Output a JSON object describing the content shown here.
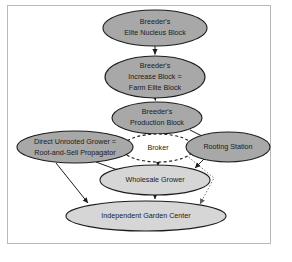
{
  "diagram": {
    "frame": {
      "border_color": "#b9b9b9",
      "background": "#ffffff"
    },
    "palette": {
      "node_dark_fill": "#a8a8a8",
      "node_light_fill": "#d6d6d6",
      "node_open_fill": "#ffffff",
      "stroke": "#1c1c1c",
      "dotted_edge": "#7d7d7d"
    },
    "nodes": [
      {
        "id": "elite-nucleus-block",
        "label_lines": [
          "Breeder's",
          "Elite Nucleus Block"
        ],
        "style": "dark-filled-ellipse",
        "cx": 155,
        "cy": 28,
        "rx": 52,
        "ry": 18
      },
      {
        "id": "increase-block",
        "label_lines": [
          "Breeder's",
          "Increase Block =",
          "Farm Elite Block"
        ],
        "style": "dark-filled-ellipse",
        "cx": 155,
        "cy": 77,
        "rx": 50,
        "ry": 21
      },
      {
        "id": "production-block",
        "label_lines": [
          "Breeder's",
          "Production Block"
        ],
        "style": "dark-filled-ellipse",
        "cx": 157,
        "cy": 118,
        "rx": 45,
        "ry": 16
      },
      {
        "id": "direct-unrooted-grower",
        "label_lines": [
          "Direct Unrooted Grower =",
          "Root-and-Sell Propagator"
        ],
        "style": "dark-filled-ellipse",
        "cx": 75,
        "cy": 147,
        "rx": 58,
        "ry": 16
      },
      {
        "id": "broker",
        "label_lines": [
          "Broker"
        ],
        "style": "dashed-open-ellipse",
        "cx": 158,
        "cy": 148,
        "rx": 36,
        "ry": 14
      },
      {
        "id": "rooting-station",
        "label_lines": [
          "Rooting Station"
        ],
        "style": "dark-filled-ellipse",
        "cx": 228,
        "cy": 147,
        "rx": 42,
        "ry": 15
      },
      {
        "id": "wholesale-grower",
        "label_lines": [
          "Wholesale Grower"
        ],
        "style": "light-filled-ellipse",
        "cx": 155,
        "cy": 180,
        "rx": 55,
        "ry": 15
      },
      {
        "id": "independent-garden-center",
        "label_lines": [
          "Independent Garden Center"
        ],
        "style": "light-filled-ellipse",
        "cx": 146,
        "cy": 216,
        "rx": 80,
        "ry": 15
      }
    ],
    "edges": [
      {
        "id": "elite-to-increase",
        "from": "elite-nucleus-block",
        "to": "increase-block",
        "style": "solid",
        "arrow": true
      },
      {
        "id": "increase-to-production",
        "from": "increase-block",
        "to": "production-block",
        "style": "solid",
        "arrow": true
      },
      {
        "id": "production-to-broker",
        "from": "production-block",
        "to": "broker",
        "style": "solid",
        "arrow": true
      },
      {
        "id": "production-to-rooting-station",
        "from": "production-block",
        "to": "rooting-station",
        "style": "solid",
        "arrow": true
      },
      {
        "id": "broker-to-direct-unrooted-grower",
        "from": "broker",
        "to": "direct-unrooted-grower",
        "style": "dashed",
        "arrow": true
      },
      {
        "id": "broker-to-wholesale-grower",
        "from": "broker",
        "to": "wholesale-grower",
        "style": "dashed",
        "arrow": true
      },
      {
        "id": "broker-to-independent-garden-center",
        "from": "broker",
        "to": "independent-garden-center",
        "style": "dotted",
        "arrow": true
      },
      {
        "id": "direct-to-wholesale-grower",
        "from": "direct-unrooted-grower",
        "to": "wholesale-grower",
        "style": "solid",
        "arrow": true
      },
      {
        "id": "direct-to-independent-garden-center",
        "from": "direct-unrooted-grower",
        "to": "independent-garden-center",
        "style": "solid",
        "arrow": true
      },
      {
        "id": "rooting-station-to-wholesale-grower",
        "from": "rooting-station",
        "to": "wholesale-grower",
        "style": "solid",
        "arrow": true
      },
      {
        "id": "wholesale-to-independent-garden-center",
        "from": "wholesale-grower",
        "to": "independent-garden-center",
        "style": "solid",
        "arrow": true
      }
    ]
  }
}
